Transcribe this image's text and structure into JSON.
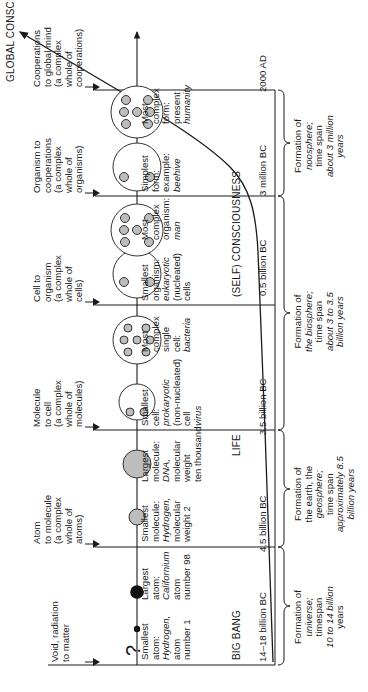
{
  "diagram": {
    "title": "GLOBAL CONSCIOUSNESS",
    "transitions": [
      {
        "id": "void",
        "lines": [
          "Void, radiation",
          "to matter"
        ]
      },
      {
        "id": "atom",
        "lines": [
          "Atom",
          "to molecule",
          "(a complex",
          "whole of",
          "atoms)"
        ]
      },
      {
        "id": "molecule",
        "lines": [
          "Molecule",
          "to cell",
          "(a complex",
          "whole of",
          "molecules)"
        ]
      },
      {
        "id": "cell",
        "lines": [
          "Cell to",
          "organism",
          "(a complex",
          "whole of",
          "cells)"
        ]
      },
      {
        "id": "organism",
        "lines": [
          "Organism to",
          "cooperations",
          "(a complex",
          "whole of",
          "organisms)"
        ]
      },
      {
        "id": "cooperations",
        "lines": [
          "Cooperations",
          "to global mind",
          "(a complex",
          "whole of",
          "cooperations)"
        ]
      }
    ],
    "question_mark": "?",
    "stages": {
      "atoms": {
        "smallest": [
          "Smallest",
          "atom:",
          "Hydrogen,",
          "atom",
          "number 1"
        ],
        "largest": [
          "Largest",
          "atom:",
          "Californium",
          "atom",
          "number 98"
        ]
      },
      "molecules": {
        "smallest": [
          "Smallest",
          "molecule:",
          "Hydrogen,",
          "molecular",
          "weight 2"
        ],
        "largest": [
          "Largest",
          "molecule:",
          "DNA,",
          "molecular",
          "weight",
          "ten thousand"
        ]
      },
      "cells": {
        "smallest": [
          "Smallest",
          "cell:",
          "prokaryotic",
          "(non-nucleated)",
          "cell",
          "virus"
        ],
        "largest": [
          "Most",
          "complex",
          "single",
          "cell:",
          "bacteria"
        ]
      },
      "organisms": {
        "smallest": [
          "Smallest",
          "organism:",
          "eukaryotic",
          "(nucleated)",
          "cells"
        ],
        "largest": [
          "Most",
          "complex",
          "organism:",
          "man"
        ]
      },
      "cooperations": {
        "smallest": [
          "Simplest",
          "form:",
          "example:",
          "beehive"
        ],
        "largest": [
          "Most",
          "complex",
          "form:",
          "present",
          "humanity"
        ]
      }
    },
    "curve_labels": {
      "big_bang": "BIG BANG",
      "life": "LIFE",
      "self_consciousness": "(SELF) CONSCIOUSNESS"
    },
    "timeline": [
      {
        "id": "t0",
        "label": "14–18 billion BC"
      },
      {
        "id": "t1",
        "label": "4.5 billion BC"
      },
      {
        "id": "t2",
        "label": "3.5 billion BC"
      },
      {
        "id": "t3",
        "label": "0.5 billion BC"
      },
      {
        "id": "t4",
        "label": "3 million BC"
      },
      {
        "id": "t5",
        "label": "2000 AD"
      }
    ],
    "eras": [
      {
        "id": "universe",
        "lines": [
          "Formation of",
          "universe;",
          "timespan",
          "10 to 14 billion",
          "years"
        ]
      },
      {
        "id": "geosphere",
        "lines": [
          "Formation of",
          "the earth, the",
          "geosphere;",
          "time span",
          "approximately 8.5",
          "billion years"
        ]
      },
      {
        "id": "biosphere",
        "lines": [
          "Formation of",
          "the biosphere;",
          "time span",
          "about 3 to 3.5",
          "billion years"
        ]
      },
      {
        "id": "noosphere",
        "lines": [
          "Formation of",
          "noosphere;",
          "time span",
          "about 3 million",
          "years"
        ]
      }
    ]
  }
}
